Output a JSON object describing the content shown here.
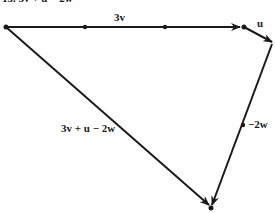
{
  "title": "15. 3v + u − 2w",
  "labels": {
    "v3": "3v",
    "u": "u",
    "w2": "−2w",
    "resultant": "3v + u − 2w"
  },
  "colors": {
    "ink": "#1a1a1a",
    "background": "#ffffff"
  },
  "vectors": [
    {
      "name": "3v",
      "from": [
        6,
        27
      ],
      "to": [
        244,
        27
      ],
      "dots": [
        [
          85,
          27
        ],
        [
          165,
          27
        ]
      ]
    },
    {
      "name": "u",
      "from": [
        244,
        27
      ],
      "to": [
        272,
        42
      ]
    },
    {
      "name": "-2w",
      "from": [
        272,
        42
      ],
      "to": [
        211,
        208
      ],
      "dots": [
        [
          243,
          125
        ]
      ]
    },
    {
      "name": "3v + u - 2w",
      "from": [
        6,
        27
      ],
      "to": [
        211,
        208
      ]
    }
  ]
}
